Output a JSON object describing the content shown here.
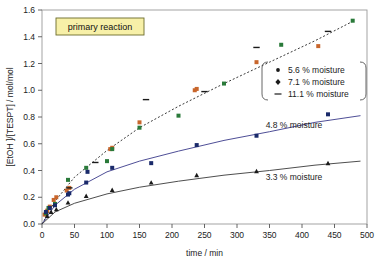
{
  "chart_data": {
    "type": "scatter",
    "title": "",
    "annotation_box": "primary reaction",
    "xlabel": "time / min",
    "ylabel": "[EtOH ]/[TESPT] / mol/mol",
    "xlim": [
      0,
      500
    ],
    "ylim": [
      0.0,
      1.6
    ],
    "xticks": [
      "0",
      "50",
      "100",
      "150",
      "200",
      "250",
      "300",
      "350",
      "400",
      "450",
      "500"
    ],
    "yticks": [
      "0.0",
      "0.2",
      "0.4",
      "0.6",
      "0.8",
      "1.0",
      "1.2",
      "1.4",
      "1.6"
    ],
    "grid": false,
    "legend_position": "inside-right",
    "legend_entries": [
      {
        "label": "5.6 % moisture",
        "marker": "dot",
        "color": "#c8662c"
      },
      {
        "label": "7.1 % moisture",
        "marker": "diamond",
        "color": "#2a7a3a"
      },
      {
        "label": "11.1 % moisture",
        "marker": "dash",
        "color": "#1a1a1a"
      }
    ],
    "inline_labels": [
      {
        "text": "4.8 % moisture",
        "x": 400,
        "y": 0.72
      },
      {
        "text": "3.3 % moisture",
        "x": 400,
        "y": 0.33
      }
    ],
    "series": [
      {
        "name": "5.6 % moisture",
        "color": "#c8662c",
        "marker": "square",
        "points": [
          [
            4,
            0.07
          ],
          [
            8,
            0.1
          ],
          [
            12,
            0.13
          ],
          [
            18,
            0.18
          ],
          [
            22,
            0.2
          ],
          [
            38,
            0.25
          ],
          [
            42,
            0.27
          ],
          [
            105,
            0.56
          ],
          [
            108,
            0.57
          ],
          [
            150,
            0.76
          ],
          [
            235,
            1.0
          ],
          [
            238,
            1.01
          ],
          [
            330,
            1.21
          ],
          [
            425,
            1.33
          ]
        ]
      },
      {
        "name": "7.1 % moisture",
        "color": "#2a7a3a",
        "marker": "square",
        "points": [
          [
            6,
            0.08
          ],
          [
            10,
            0.12
          ],
          [
            20,
            0.15
          ],
          [
            40,
            0.33
          ],
          [
            68,
            0.42
          ],
          [
            100,
            0.47
          ],
          [
            108,
            0.56
          ],
          [
            150,
            0.72
          ],
          [
            210,
            0.81
          ],
          [
            280,
            1.05
          ],
          [
            368,
            1.34
          ],
          [
            478,
            1.52
          ]
        ]
      },
      {
        "name": "11.1 % moisture",
        "color": "#1a1a1a",
        "marker": "dash",
        "points": [
          [
            42,
            0.27
          ],
          [
            82,
            0.46
          ],
          [
            160,
            0.93
          ],
          [
            250,
            0.99
          ],
          [
            330,
            1.32
          ],
          [
            440,
            1.44
          ]
        ]
      },
      {
        "name": "4.8 % moisture",
        "color": "#1a2a6a",
        "marker": "square",
        "points": [
          [
            6,
            0.09
          ],
          [
            12,
            0.12
          ],
          [
            20,
            0.14
          ],
          [
            40,
            0.22
          ],
          [
            42,
            0.23
          ],
          [
            68,
            0.31
          ],
          [
            70,
            0.39
          ],
          [
            108,
            0.42
          ],
          [
            168,
            0.455
          ],
          [
            238,
            0.59
          ],
          [
            330,
            0.66
          ],
          [
            440,
            0.82
          ]
        ]
      },
      {
        "name": "3.3 % moisture",
        "color": "#1a1a1a",
        "marker": "triangle",
        "points": [
          [
            8,
            0.06
          ],
          [
            14,
            0.09
          ],
          [
            22,
            0.11
          ],
          [
            40,
            0.16
          ],
          [
            68,
            0.21
          ],
          [
            108,
            0.255
          ],
          [
            168,
            0.31
          ],
          [
            238,
            0.365
          ],
          [
            330,
            0.395
          ],
          [
            440,
            0.455
          ]
        ]
      }
    ],
    "fit_curves": [
      {
        "name": "high-moisture fit",
        "style": "dotted",
        "color": "#3a3a3a",
        "control": [
          [
            0,
            0.0
          ],
          [
            20,
            0.17
          ],
          [
            50,
            0.35
          ],
          [
            100,
            0.55
          ],
          [
            150,
            0.72
          ],
          [
            210,
            0.88
          ],
          [
            280,
            1.05
          ],
          [
            350,
            1.21
          ],
          [
            420,
            1.37
          ],
          [
            480,
            1.52
          ]
        ]
      },
      {
        "name": "4.8 % fit",
        "style": "solid",
        "color": "#3a3a8a",
        "control": [
          [
            0,
            0.0
          ],
          [
            20,
            0.14
          ],
          [
            50,
            0.26
          ],
          [
            100,
            0.39
          ],
          [
            150,
            0.47
          ],
          [
            210,
            0.545
          ],
          [
            280,
            0.625
          ],
          [
            350,
            0.69
          ],
          [
            420,
            0.76
          ],
          [
            490,
            0.81
          ]
        ]
      },
      {
        "name": "3.3 % fit",
        "style": "solid",
        "color": "#3a3a3a",
        "control": [
          [
            0,
            0.0
          ],
          [
            20,
            0.09
          ],
          [
            50,
            0.155
          ],
          [
            100,
            0.225
          ],
          [
            150,
            0.275
          ],
          [
            210,
            0.32
          ],
          [
            280,
            0.365
          ],
          [
            350,
            0.4
          ],
          [
            420,
            0.44
          ],
          [
            490,
            0.47
          ]
        ]
      }
    ]
  }
}
